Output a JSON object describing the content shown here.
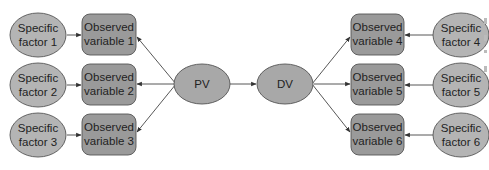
{
  "colors": {
    "specific_factor_fill": "#b4b4b4",
    "observed_variable_fill": "#9a9a9a",
    "latent_fill": "#a8a8a8",
    "stroke": "#555555",
    "edge": "#444444",
    "text": "#222222"
  },
  "latent": {
    "pv": {
      "label": "PV"
    },
    "dv": {
      "label": "DV"
    }
  },
  "left": [
    {
      "factor_line1": "Specific",
      "factor_line2": "factor 1",
      "var_line1": "Observed",
      "var_line2": "variable 1"
    },
    {
      "factor_line1": "Specific",
      "factor_line2": "factor 2",
      "var_line1": "Observed",
      "var_line2": "variable 2"
    },
    {
      "factor_line1": "Specific",
      "factor_line2": "factor 3",
      "var_line1": "Observed",
      "var_line2": "variable 3"
    }
  ],
  "right": [
    {
      "factor_line1": "Specific",
      "factor_line2": "factor 4",
      "var_line1": "Observed",
      "var_line2": "variable 4"
    },
    {
      "factor_line1": "Specific",
      "factor_line2": "factor 5",
      "var_line1": "Observed",
      "var_line2": "variable 5"
    },
    {
      "factor_line1": "Specific",
      "factor_line2": "factor 6",
      "var_line1": "Observed",
      "var_line2": "variable 6"
    }
  ]
}
